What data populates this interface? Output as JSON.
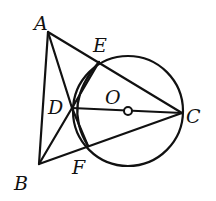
{
  "diagram": {
    "type": "geometry",
    "stroke_color": "#111111",
    "background": "#ffffff",
    "points": {
      "A": {
        "label": "A",
        "x": 48,
        "y": 32
      },
      "B": {
        "label": "B",
        "x": 39,
        "y": 164
      },
      "C": {
        "label": "C",
        "x": 182,
        "y": 113
      },
      "D": {
        "label": "D",
        "x": 72,
        "y": 108
      },
      "E": {
        "label": "E",
        "x": 99,
        "y": 62
      },
      "F": {
        "label": "F",
        "x": 88,
        "y": 146
      },
      "O": {
        "label": "O",
        "x": 128,
        "y": 110
      }
    },
    "labels": {
      "A": "A",
      "B": "B",
      "C": "C",
      "D": "D",
      "E": "E",
      "F": "F",
      "O": "O"
    },
    "segments": [
      "AB",
      "AC",
      "BC",
      "AD",
      "BD",
      "DC",
      "DE",
      "DF"
    ],
    "circles": [
      {
        "name": "circle-O",
        "center": "O",
        "radius": 55
      }
    ]
  }
}
